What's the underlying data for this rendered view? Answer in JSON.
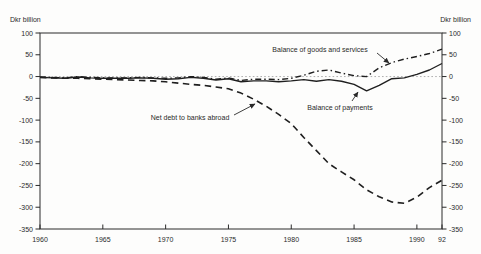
{
  "colors": {
    "line": "#1f1f1f",
    "zero_line": "#9a9a9a",
    "frame": "#2a2a2a",
    "background": "#fdfdfc",
    "text": "#2a2a2a"
  },
  "chart_data": {
    "type": "line",
    "title": "",
    "ylabel_left": "Dkr billion",
    "ylabel_right": "Dkr billion",
    "xlim": [
      1960,
      1992
    ],
    "ylim": [
      -350,
      100
    ],
    "grid": false,
    "zero_line": true,
    "legend_position": "inline-annotations",
    "x_ticks": [
      {
        "year": 1960,
        "label": "1960"
      },
      {
        "year": 1965,
        "label": "1965"
      },
      {
        "year": 1970,
        "label": "1970"
      },
      {
        "year": 1975,
        "label": "1975"
      },
      {
        "year": 1980,
        "label": "1980"
      },
      {
        "year": 1985,
        "label": "1985"
      },
      {
        "year": 1990,
        "label": "1990"
      },
      {
        "year": 1992,
        "label": "92"
      }
    ],
    "y_ticks": [
      100,
      50,
      0,
      -50,
      -100,
      -150,
      -200,
      -250,
      -300,
      -350
    ],
    "x": [
      1960,
      1961,
      1962,
      1963,
      1964,
      1965,
      1966,
      1967,
      1968,
      1969,
      1970,
      1971,
      1972,
      1973,
      1974,
      1975,
      1976,
      1977,
      1978,
      1979,
      1980,
      1981,
      1982,
      1983,
      1984,
      1985,
      1986,
      1987,
      1988,
      1989,
      1990,
      1991,
      1992
    ],
    "series": [
      {
        "name": "Balance of goods and services",
        "style": "dashdot",
        "values": [
          -1,
          -2,
          -3,
          0,
          -2,
          -3,
          -3,
          -3,
          -2,
          -3,
          -4,
          -3,
          0,
          -2,
          -6,
          -3,
          -9,
          -6,
          -6,
          -7,
          -4,
          3,
          12,
          15,
          8,
          2,
          0,
          20,
          32,
          40,
          46,
          53,
          63
        ]
      },
      {
        "name": "Balance of payments",
        "style": "solid",
        "values": [
          -2,
          -3,
          -4,
          -1,
          -3,
          -4,
          -4,
          -4,
          -3,
          -4,
          -6,
          -5,
          -2,
          -4,
          -8,
          -5,
          -12,
          -10,
          -10,
          -12,
          -10,
          -7,
          -11,
          -7,
          -11,
          -18,
          -33,
          -20,
          -5,
          -3,
          5,
          15,
          30
        ]
      },
      {
        "name": "Net debt to banks abroad",
        "style": "dashed",
        "values": [
          -2,
          -3,
          -4,
          -4,
          -5,
          -6,
          -7,
          -8,
          -9,
          -10,
          -12,
          -15,
          -18,
          -20,
          -24,
          -28,
          -38,
          -52,
          -68,
          -87,
          -108,
          -140,
          -170,
          -200,
          -219,
          -237,
          -260,
          -276,
          -288,
          -291,
          -277,
          -255,
          -238
        ]
      }
    ],
    "annotations": [
      {
        "text": "Balance of goods and services",
        "x": 320,
        "y": 49,
        "arrow": {
          "x1": 377,
          "y1": 53,
          "x2": 389,
          "y2": 63
        }
      },
      {
        "text": "Balance of payments",
        "x": 340,
        "y": 107,
        "arrow": {
          "x1": 352,
          "y1": 101,
          "x2": 358,
          "y2": 92
        }
      },
      {
        "text": "Net debt to banks abroad",
        "x": 190,
        "y": 117,
        "arrow": {
          "x1": 234,
          "y1": 115,
          "x2": 255,
          "y2": 104
        }
      }
    ]
  }
}
